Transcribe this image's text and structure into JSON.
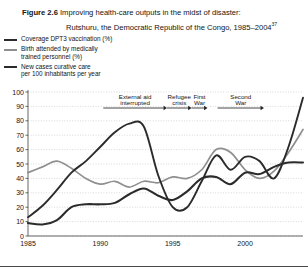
{
  "figure": {
    "number": "Figure 2.6",
    "title_line1": "Improving health-care outputs in the midst of disaster:",
    "title_line2": "Rutshuru, the Democratic Republic of the Congo, 1985–2004",
    "footnote_marker": "37"
  },
  "legend": {
    "position": "above-plot-left",
    "items": [
      {
        "label": "Coverage DPT3 vaccination (%)",
        "color": "#2b2b2b",
        "key": "dpt3"
      },
      {
        "label": "Birth attended by medically\ntrained personnel (%)",
        "label_l1": "Birth attended by medically",
        "label_l2": "trained personnel (%)",
        "color": "#8f8f8f",
        "key": "births"
      },
      {
        "label": "New cases curative care\nper 100 inhabitants per year",
        "label_l1": "New cases curative care",
        "label_l2": "per 100 inhabitants per year",
        "color": "#2b2b2b",
        "key": "curative"
      }
    ]
  },
  "chart_data": {
    "type": "line",
    "title": "Improving health-care outputs in the midst of disaster: Rutshuru, the Democratic Republic of the Congo, 1985–2004",
    "xlabel": "",
    "ylabel": "",
    "xlim": [
      1985,
      2004
    ],
    "ylim": [
      0,
      100
    ],
    "grid": true,
    "grid_style": "dotted-horizontal",
    "legend_position": "above-plot-left",
    "x": [
      1985,
      1986,
      1987,
      1988,
      1989,
      1990,
      1991,
      1992,
      1993,
      1994,
      1995,
      1996,
      1997,
      1998,
      1999,
      2000,
      2001,
      2002,
      2003,
      2004
    ],
    "xticks": [
      1985,
      1990,
      1995,
      2000
    ],
    "xticklabels": [
      "1985",
      "1990",
      "1995",
      "2000"
    ],
    "yticks": [
      0,
      10,
      20,
      30,
      40,
      50,
      60,
      70,
      80,
      90,
      100
    ],
    "yticklabels": [
      "0",
      "10",
      "20",
      "30",
      "40",
      "50",
      "60",
      "70",
      "80",
      "90",
      "100"
    ],
    "series": [
      {
        "name": "Coverage DPT3 vaccination (%)",
        "key": "dpt3",
        "color": "#2b2b2b",
        "width": 1.9,
        "values": [
          13,
          21,
          32,
          44,
          52,
          62,
          72,
          78,
          76,
          42,
          20,
          20,
          38,
          56,
          46,
          55,
          52,
          40,
          62,
          96
        ]
      },
      {
        "name": "Birth attended by medically trained personnel (%)",
        "key": "births",
        "color": "#8f8f8f",
        "width": 1.7,
        "values": [
          44,
          48,
          52,
          47,
          40,
          36,
          38,
          34,
          38,
          37,
          41,
          40,
          46,
          60,
          58,
          46,
          40,
          45,
          58,
          74
        ]
      },
      {
        "name": "New cases curative care per 100 inhabitants per year",
        "key": "curative",
        "color": "#2b2b2b",
        "width": 2.1,
        "values": [
          9,
          8,
          11,
          20,
          22,
          22,
          23,
          29,
          33,
          28,
          25,
          31,
          40,
          41,
          36,
          44,
          43,
          48,
          51,
          51
        ]
      }
    ],
    "annotations": [
      {
        "label_l1": "External aid",
        "label_l2": "interrupted",
        "text": "External aid interrupted",
        "x_start": 1990.2,
        "x_end": 1994.6,
        "arrow": "right"
      },
      {
        "label_l1": "Refugee",
        "label_l2": "crisis",
        "text": "Refugee crisis",
        "x_start": 1994.6,
        "x_end": 1996.3,
        "arrow": "right"
      },
      {
        "label_l1": "First",
        "label_l2": "War",
        "text": "First War",
        "x_start": 1996.3,
        "x_end": 1997.4,
        "arrow": "right"
      },
      {
        "label_l1": "Second",
        "label_l2": "War",
        "text": "Second War",
        "x_start": 1998.1,
        "x_end": 2001.3,
        "arrow": "right"
      }
    ]
  },
  "colors": {
    "axis": "#555555",
    "grid": "#c9c9c9",
    "text": "#141414",
    "series_dark": "#2b2b2b",
    "series_gray": "#8f8f8f",
    "rule": "#4a4a4a"
  }
}
